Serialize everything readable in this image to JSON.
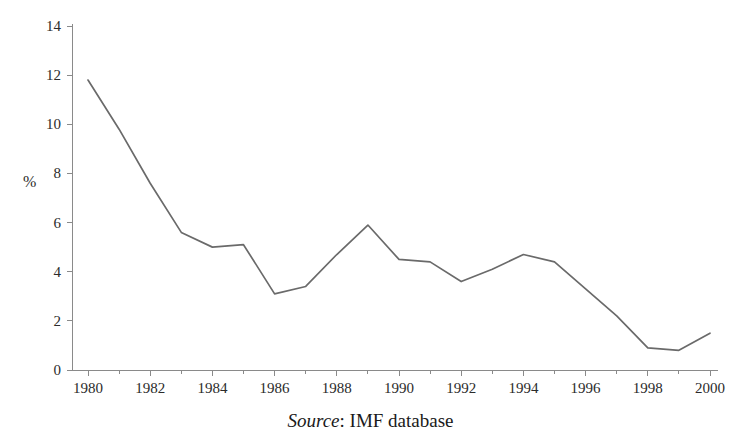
{
  "figure": {
    "title_partial": "",
    "ylabel": "%",
    "source_prefix": "Source",
    "source_separator": ":",
    "source_text": "IMF database"
  },
  "chart_data": {
    "type": "line",
    "title": "",
    "xlabel": "",
    "ylabel": "%",
    "xlim": [
      1980,
      2000
    ],
    "ylim": [
      0,
      14
    ],
    "yticks": [
      0,
      2,
      4,
      6,
      8,
      10,
      12,
      14
    ],
    "xticks": [
      1980,
      1982,
      1984,
      1986,
      1988,
      1990,
      1992,
      1994,
      1996,
      1998,
      2000
    ],
    "xtick_labels": [
      "1980",
      "1982",
      "1984",
      "1986",
      "1988",
      "1990",
      "1992",
      "1994",
      "1996",
      "1998",
      "2000"
    ],
    "ytick_labels": [
      "0",
      "2",
      "4",
      "6",
      "8",
      "10",
      "12",
      "14"
    ],
    "x_minor_step": 1,
    "grid": false,
    "legend": null,
    "line_color": "#6a6a6a",
    "axis_color": "#8a8a8a",
    "x": [
      1980,
      1981,
      1982,
      1983,
      1984,
      1985,
      1986,
      1987,
      1988,
      1989,
      1990,
      1991,
      1992,
      1993,
      1994,
      1995,
      1996,
      1997,
      1998,
      1999,
      2000
    ],
    "values": [
      11.8,
      9.8,
      7.6,
      5.6,
      5.0,
      5.1,
      3.1,
      3.4,
      4.7,
      5.9,
      4.5,
      4.4,
      3.6,
      4.1,
      4.7,
      4.4,
      3.3,
      2.2,
      0.9,
      0.8,
      1.5
    ],
    "series": [
      {
        "name": "",
        "values": [
          11.8,
          9.8,
          7.6,
          5.6,
          5.0,
          5.1,
          3.1,
          3.4,
          4.7,
          5.9,
          4.5,
          4.4,
          3.6,
          4.1,
          4.7,
          4.4,
          3.3,
          2.2,
          0.9,
          0.8,
          1.5
        ]
      }
    ],
    "source": "Source: IMF database"
  }
}
